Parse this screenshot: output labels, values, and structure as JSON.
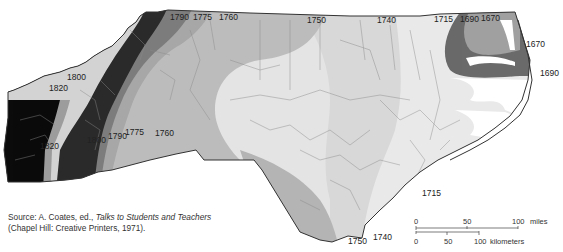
{
  "map": {
    "subject": "North Carolina settlement frontier dates",
    "isochrone_labels": {
      "top": [
        "1790",
        "1775",
        "1760",
        "1750",
        "1740",
        "1715",
        "1690",
        "1670"
      ],
      "west": [
        "1800",
        "1820"
      ],
      "southwest": [
        "1820",
        "1800",
        "1790",
        "1775",
        "1760"
      ],
      "northeast": [
        "1670",
        "1690"
      ],
      "southeast": [
        "1715",
        "1750",
        "1740"
      ]
    },
    "shading": {
      "1670": "#9a9a9a",
      "1690": "#6b6b6b",
      "1715": "#e6e6e6",
      "1740": "#d9d9d9",
      "1750": "#bdbdbd",
      "1760": "#a8a8a8",
      "1775": "#7f7f7f",
      "1790": "#2e2e2e",
      "1800": "#d4d4d4",
      "1820": "#0d0d0d"
    }
  },
  "source": {
    "prefix": "Source: A. Coates, ed., ",
    "title": "Talks to Students and Teachers",
    "line2": "(Chapel Hill: Creative Printers, 1971)."
  },
  "scale_bar": {
    "miles": {
      "ticks": [
        "0",
        "50",
        "100"
      ],
      "unit": "miles"
    },
    "kilometers": {
      "ticks": [
        "0",
        "50",
        "100"
      ],
      "unit": "kilometers"
    }
  }
}
